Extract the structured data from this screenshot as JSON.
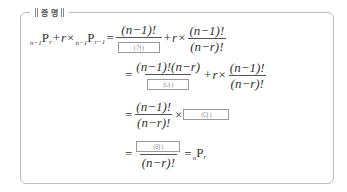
{
  "title": "증 명",
  "lhs": {
    "term1_presub": "n−1",
    "term1_P": "P",
    "term1_sub": "r",
    "plus": "+",
    "r": "r",
    "times": "×",
    "term2_presub": "n−1",
    "term2_P": "P",
    "term2_sub": "r−1"
  },
  "lines": [
    {
      "eq": "=",
      "frac1_num": "(n−1)!",
      "frac1_box": "(가)",
      "plus": "+",
      "r": "r",
      "times": "×",
      "frac2_num": "(n−1)!",
      "frac2_den": "(n−r)!"
    },
    {
      "eq": "=",
      "frac1_num": "(n−1)!(n−r)",
      "frac1_box": "(나)",
      "plus": "+",
      "r": "r",
      "times": "×",
      "frac2_num": "(n−1)!",
      "frac2_den": "(n−r)!"
    },
    {
      "eq": "=",
      "frac_num": "(n−1)!",
      "frac_den": "(n−r)!",
      "times": "×",
      "box": "(다)"
    },
    {
      "eq": "=",
      "frac_box": "(라)",
      "frac_den": "(n−r)!",
      "eq2": "=",
      "result_presub": "n",
      "result_P": "P",
      "result_sub": "r"
    }
  ]
}
